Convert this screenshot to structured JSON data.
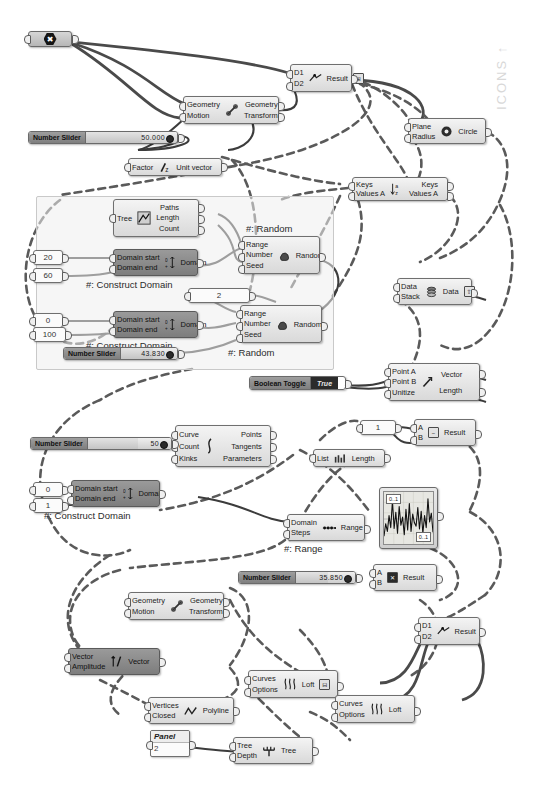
{
  "app": {
    "title": "Grasshopper Definition Canvas",
    "watermark": "ICONS ↑",
    "background": "#ffffff",
    "wire_color": "#4a4a4a",
    "node_fill": "#e7e7e7",
    "node_stroke": "#6f6f6f"
  },
  "groups": [
    {
      "name": "random-domain-group",
      "label": ""
    }
  ],
  "nodes": {
    "origin_point": {
      "glyph": "✖",
      "label": ""
    },
    "move_top": {
      "inputs": [
        "Geometry",
        "Motion"
      ],
      "outputs": [
        "Geometry",
        "Transform"
      ],
      "icon": "move-icon"
    },
    "move_bottom": {
      "inputs": [
        "Geometry",
        "Motion"
      ],
      "outputs": [
        "Geometry",
        "Transform"
      ],
      "icon": "move-icon"
    },
    "unit_vector": {
      "inputs": [
        "Factor"
      ],
      "outputs": [
        "Unit vector"
      ],
      "icon": "unit-z-icon"
    },
    "distance_top": {
      "inputs": [
        "D1",
        "D2"
      ],
      "outputs": [
        "Result"
      ],
      "icon": "distance-icon",
      "badge": "⊞"
    },
    "distance_bottom": {
      "inputs": [
        "D1",
        "D2"
      ],
      "outputs": [
        "Result"
      ],
      "icon": "distance-icon"
    },
    "circle": {
      "inputs": [
        "Plane",
        "Radius"
      ],
      "outputs": [
        "Circle"
      ],
      "icon": "circle-icon"
    },
    "sort_list": {
      "inputs": [
        "Keys",
        "Values A"
      ],
      "outputs": [
        "Keys",
        "Values A"
      ],
      "icon": "sort-az-icon"
    },
    "tree_statistics": {
      "inputs": [
        "Tree"
      ],
      "outputs": [
        "Paths",
        "Length",
        "Count"
      ],
      "icon": "tree-stats-icon"
    },
    "construct_domain_1": {
      "inputs": [
        "Domain start",
        "Domain end"
      ],
      "outputs": [
        "Domain"
      ],
      "caption": "#: Construct Domain",
      "icon": "domain-icon"
    },
    "construct_domain_2": {
      "inputs": [
        "Domain start",
        "Domain end"
      ],
      "outputs": [
        "Domain"
      ],
      "caption": "#: Construct Domain",
      "icon": "domain-icon"
    },
    "construct_domain_3": {
      "inputs": [
        "Domain start",
        "Domain end"
      ],
      "outputs": [
        "Domain"
      ],
      "caption": "#: Construct Domain",
      "icon": "domain-icon"
    },
    "random_1": {
      "inputs": [
        "Range",
        "Number",
        "Seed"
      ],
      "outputs": [
        "Random"
      ],
      "caption": "#: Random",
      "icon": "random-icon"
    },
    "random_2": {
      "inputs": [
        "Range",
        "Number",
        "Seed"
      ],
      "outputs": [
        "Random"
      ],
      "caption": "#: Random",
      "icon": "random-icon"
    },
    "stack_data": {
      "inputs": [
        "Data",
        "Stack"
      ],
      "outputs": [
        "Data"
      ],
      "icon": "stack-data-icon",
      "badge": "⇧"
    },
    "vector_two_point": {
      "inputs": [
        "Point A",
        "Point B",
        "Unitize"
      ],
      "outputs": [
        "Vector",
        "Length"
      ],
      "icon": "vector2pt-icon"
    },
    "subtraction": {
      "inputs": [
        "A",
        "B"
      ],
      "outputs": [
        "Result"
      ],
      "icon": "minus-icon",
      "glyph": "−"
    },
    "multiplication": {
      "inputs": [
        "A",
        "B"
      ],
      "outputs": [
        "Result"
      ],
      "icon": "times-icon",
      "glyph": "✕"
    },
    "curve_analysis": {
      "inputs": [
        "Curve",
        "Count",
        "Kinks"
      ],
      "outputs": [
        "Points",
        "Tangents",
        "Parameters"
      ],
      "icon": "divide-curve-icon"
    },
    "list_length": {
      "inputs": [
        "List"
      ],
      "outputs": [
        "Length"
      ],
      "icon": "list-length-icon"
    },
    "range": {
      "inputs": [
        "Domain",
        "Steps"
      ],
      "outputs": [
        "Range"
      ],
      "caption": "#: Range",
      "icon": "range-icon"
    },
    "amplitude": {
      "inputs": [
        "Vector",
        "Amplitude"
      ],
      "outputs": [
        "Vector"
      ],
      "icon": "amplitude-icon"
    },
    "polyline": {
      "inputs": [
        "Vertices",
        "Closed"
      ],
      "outputs": [
        "Polyline"
      ],
      "icon": "polyline-icon"
    },
    "tree_branch": {
      "inputs": [
        "Tree",
        "Depth"
      ],
      "outputs": [
        "Tree"
      ],
      "icon": "tree-icon"
    },
    "loft_1": {
      "inputs": [
        "Curves",
        "Options"
      ],
      "outputs": [
        "Loft"
      ],
      "icon": "loft-icon",
      "badge": "⊟"
    },
    "loft_2": {
      "inputs": [
        "Curves",
        "Options"
      ],
      "outputs": [
        "Loft"
      ],
      "icon": "loft-icon"
    }
  },
  "sliders": [
    {
      "name": "slider-top",
      "label": "Number Slider",
      "value": "50.000",
      "fill_pct": 62
    },
    {
      "name": "slider-random",
      "label": "Number Slider",
      "value": "43.830",
      "fill_pct": 58
    },
    {
      "name": "slider-curve",
      "label": "Number Slider",
      "value": "50",
      "fill_pct": 60
    },
    {
      "name": "slider-mult",
      "label": "Number Slider",
      "value": "35.850",
      "fill_pct": 55
    }
  ],
  "params": [
    {
      "name": "number-20",
      "value": "20"
    },
    {
      "name": "number-60",
      "value": "60"
    },
    {
      "name": "number-2",
      "value": "2"
    },
    {
      "name": "number-0a",
      "value": "0"
    },
    {
      "name": "number-100",
      "value": "100"
    },
    {
      "name": "number-1a",
      "value": "1"
    },
    {
      "name": "number-0b",
      "value": "0"
    },
    {
      "name": "number-1b",
      "value": "1"
    }
  ],
  "toggle": {
    "label": "Boolean Toggle",
    "state": "True"
  },
  "panel": {
    "header": "Panel",
    "value": "2"
  },
  "graph": {
    "top_left_label": "0..1",
    "bottom_right_label": "0..1",
    "name": "quick-graph",
    "series": [
      0.12,
      0.38,
      0.22,
      0.55,
      0.3,
      0.86,
      0.28,
      0.62,
      0.18,
      0.74,
      0.35,
      0.52,
      0.15,
      0.68,
      0.25,
      0.8,
      0.22,
      0.58,
      0.4,
      0.33,
      0.72,
      0.27,
      0.64,
      0.18,
      0.55,
      0.3,
      0.9,
      0.42,
      0.6,
      0.2
    ]
  }
}
